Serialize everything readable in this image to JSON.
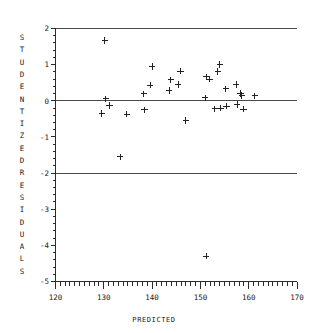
{
  "chart_data": {
    "type": "scatter",
    "title": "",
    "xlabel": "PREDICTED",
    "ylabel": "STUDENTIZED RESIDUALS",
    "xlim": [
      120,
      170
    ],
    "ylim": [
      -5,
      2
    ],
    "xticks": [
      120,
      130,
      140,
      150,
      160,
      170
    ],
    "xtick_labels": [
      "120",
      "130",
      "140",
      "150",
      "160",
      "170"
    ],
    "yticks": [
      2,
      1,
      0,
      -1,
      -2,
      -3,
      -4,
      -5
    ],
    "ytick_labels": [
      "2",
      "1",
      "0",
      "-1",
      "-2",
      "-3",
      "-4",
      "-5"
    ],
    "x_minor_tick_step": 1,
    "y_minor_tick_step": 0.2,
    "grid": false,
    "legend": null,
    "marker": "plus",
    "reference_lines": [
      {
        "y": 2,
        "label": ""
      },
      {
        "y": 0,
        "label": ""
      },
      {
        "y": -2,
        "label": ""
      }
    ],
    "points": [
      {
        "x": 129.6,
        "y": -0.35
      },
      {
        "x": 130.2,
        "y": 1.67
      },
      {
        "x": 130.4,
        "y": 0.05
      },
      {
        "x": 131.2,
        "y": -0.13
      },
      {
        "x": 133.4,
        "y": -1.55
      },
      {
        "x": 134.8,
        "y": -0.37
      },
      {
        "x": 138.3,
        "y": 0.19
      },
      {
        "x": 138.4,
        "y": -0.25
      },
      {
        "x": 139.6,
        "y": 0.43
      },
      {
        "x": 140.0,
        "y": 0.95
      },
      {
        "x": 143.5,
        "y": 0.28
      },
      {
        "x": 143.9,
        "y": 0.58
      },
      {
        "x": 145.4,
        "y": 0.45
      },
      {
        "x": 145.9,
        "y": 0.82
      },
      {
        "x": 147.0,
        "y": -0.55
      },
      {
        "x": 151.0,
        "y": 0.08
      },
      {
        "x": 151.3,
        "y": 0.66
      },
      {
        "x": 151.9,
        "y": 0.6
      },
      {
        "x": 151.2,
        "y": -4.3
      },
      {
        "x": 153.0,
        "y": -0.22
      },
      {
        "x": 153.6,
        "y": 0.81
      },
      {
        "x": 154.0,
        "y": 1.0
      },
      {
        "x": 154.2,
        "y": -0.2
      },
      {
        "x": 155.3,
        "y": 0.33
      },
      {
        "x": 155.4,
        "y": -0.15
      },
      {
        "x": 157.4,
        "y": 0.45
      },
      {
        "x": 157.6,
        "y": -0.1
      },
      {
        "x": 158.3,
        "y": 0.2
      },
      {
        "x": 158.6,
        "y": 0.15
      },
      {
        "x": 158.9,
        "y": -0.23
      },
      {
        "x": 161.3,
        "y": 0.14
      }
    ]
  },
  "axes": {
    "y_title_letters": [
      "S",
      "T",
      "U",
      "D",
      "E",
      "N",
      "T",
      "I",
      "Z",
      "E",
      "D",
      "R",
      "E",
      "S",
      "I",
      "D",
      "U",
      "A",
      "L",
      "S"
    ],
    "x_title": "PREDICTED"
  },
  "colors": {
    "axis": "#2b2b2b",
    "marker": "#222222",
    "reference_line": "#4a4a4a",
    "background": "#ffffff"
  }
}
